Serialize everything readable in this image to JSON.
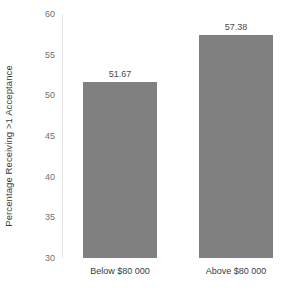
{
  "chart_data": {
    "type": "bar",
    "title": "",
    "xlabel": "",
    "ylabel": "Percentage Receiving >1 Acceptance",
    "categories": [
      "Below $80 000",
      "Above $80 000"
    ],
    "values": [
      51.67,
      57.38
    ],
    "value_labels": [
      "51.67",
      "57.38"
    ],
    "ylim": [
      30,
      60
    ],
    "ytick_labels": [
      "60",
      "55",
      "50",
      "45",
      "40",
      "35",
      "30"
    ],
    "ytick_values": [
      60,
      55,
      50,
      45,
      40,
      35,
      30
    ],
    "grid": false,
    "legend": "none",
    "bar_color": "#808080",
    "axis_color": "#e2e2e2",
    "tick_label_color": "#6f6f6f",
    "text_color": "#3b3b3b"
  }
}
